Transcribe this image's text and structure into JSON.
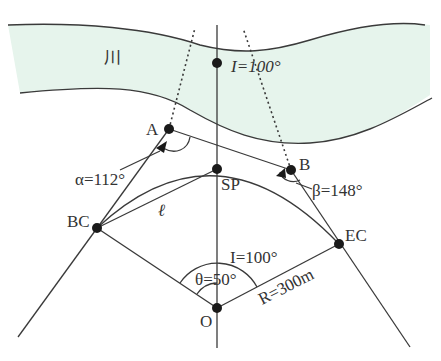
{
  "river": {
    "label": "川",
    "fill_color": "#e6f4ec"
  },
  "points": {
    "I": {
      "label": "I=100°"
    },
    "A": {
      "label": "A"
    },
    "B": {
      "label": "B"
    },
    "SP": {
      "label": "SP"
    },
    "BC": {
      "label": "BC"
    },
    "EC": {
      "label": "EC"
    },
    "O": {
      "label": "O"
    }
  },
  "angles": {
    "alpha": {
      "label": "α=112°"
    },
    "beta": {
      "label": "β=148°"
    },
    "theta": {
      "label": "θ=50°"
    },
    "central_I": {
      "label": "I=100°"
    }
  },
  "lengths": {
    "radius": {
      "label": "R=300m"
    },
    "chord": {
      "label": "ℓ"
    }
  }
}
